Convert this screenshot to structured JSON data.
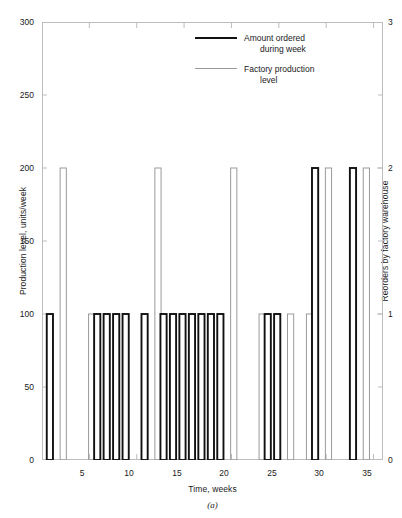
{
  "chart_data": {
    "type": "bar",
    "title": "",
    "subtitle": "",
    "caption": "(a)",
    "xlabel": "Time, weeks",
    "ylabel": "Production level, units/week",
    "y2label": "Reorders by factory warehouse",
    "xlim": [
      0,
      36
    ],
    "ylim": [
      0,
      300
    ],
    "y2lim": [
      0,
      3
    ],
    "grid": false,
    "legend_position": "top-right",
    "xticks": [
      5,
      10,
      15,
      20,
      25,
      30,
      35
    ],
    "yticks": [
      0,
      50,
      100,
      150,
      200,
      250,
      300
    ],
    "y2ticks": [
      0,
      1,
      2,
      3
    ],
    "x": [
      1,
      2,
      3,
      4,
      5,
      6,
      7,
      8,
      9,
      10,
      11,
      12,
      13,
      14,
      15,
      16,
      17,
      18,
      19,
      20,
      21,
      22,
      23,
      24,
      25,
      26,
      27,
      28,
      29,
      30,
      31,
      32,
      33,
      34,
      35
    ],
    "series": [
      {
        "name": "Amount ordered during week",
        "style": "thick-black-outline",
        "color": "#111111",
        "axis": "left",
        "values": [
          100,
          0,
          0,
          0,
          0,
          100,
          100,
          100,
          100,
          0,
          100,
          0,
          100,
          100,
          100,
          100,
          100,
          100,
          100,
          0,
          0,
          0,
          0,
          100,
          100,
          0,
          0,
          0,
          200,
          0,
          0,
          0,
          200,
          0,
          0
        ]
      },
      {
        "name": "Factory production level",
        "style": "thin-gray-outline",
        "color": "#9a9a9a",
        "axis": "left",
        "values": [
          0,
          200,
          0,
          0,
          100,
          0,
          0,
          0,
          0,
          0,
          0,
          200,
          0,
          0,
          0,
          0,
          0,
          0,
          0,
          200,
          0,
          0,
          100,
          0,
          0,
          100,
          0,
          100,
          0,
          200,
          0,
          0,
          0,
          200,
          0
        ]
      }
    ]
  },
  "legend": {
    "entries": [
      {
        "label_line1": "Amount ordered",
        "label_line2": "during week",
        "swatch": "thick-black-line"
      },
      {
        "label_line1": "Factory production",
        "label_line2": "level",
        "swatch": "thin-gray-line"
      }
    ]
  },
  "axes": {
    "left": {
      "title": "Production level, units/week",
      "tick_labels": [
        "0",
        "50",
        "100",
        "150",
        "200",
        "250",
        "300"
      ]
    },
    "right": {
      "title": "Reorders by factory warehouse",
      "tick_labels": [
        "0",
        "1",
        "2",
        "3"
      ]
    },
    "bottom": {
      "title": "Time, weeks",
      "tick_labels": [
        "5",
        "10",
        "15",
        "20",
        "25",
        "30",
        "35"
      ]
    }
  },
  "figure": {
    "caption": "(a)"
  },
  "colors": {
    "ordered": "#111111",
    "production": "#9a9a9a",
    "frame": "#bdbdbd",
    "text": "#1a1a1a",
    "background": "#ffffff"
  }
}
